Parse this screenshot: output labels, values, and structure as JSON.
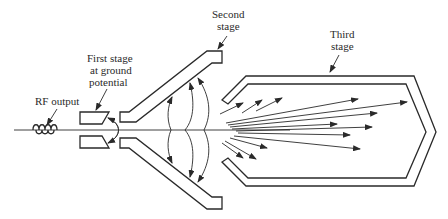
{
  "diagram": {
    "labels": {
      "rf_output": "RF output",
      "first_stage_l1": "First stage",
      "first_stage_l2": "at ground",
      "first_stage_l3": "potential",
      "second_stage_l1": "Second",
      "second_stage_l2": "stage",
      "third_stage_l1": "Third",
      "third_stage_l2": "stage"
    },
    "components": [
      {
        "id": "rf-coil",
        "name": "RF output coil"
      },
      {
        "id": "first-stage",
        "name": "First stage at ground potential"
      },
      {
        "id": "second-stage",
        "name": "Second stage"
      },
      {
        "id": "third-stage",
        "name": "Third stage"
      },
      {
        "id": "beam-axis",
        "name": "Beam axis"
      },
      {
        "id": "field-lines",
        "name": "Electric field lines"
      },
      {
        "id": "electron-trajectories",
        "name": "Spent electron trajectories"
      }
    ],
    "colors": {
      "line": "#2a2a2a",
      "background": "#ffffff"
    }
  }
}
